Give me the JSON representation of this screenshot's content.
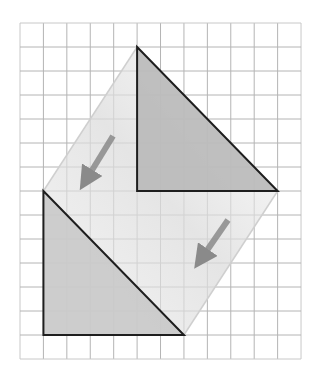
{
  "diagram": {
    "type": "translation-on-grid",
    "grid": {
      "origin_px": [
        20,
        23
      ],
      "columns": 12,
      "rows": 14,
      "cell_w": 23.42,
      "cell_h": 24.0,
      "line_color": "#b4b4b4",
      "border_color": "#c8c8c8"
    },
    "preimage": {
      "label": "",
      "shape": "right-triangle",
      "vertices_grid": [
        [
          5,
          1
        ],
        [
          5,
          7
        ],
        [
          11,
          7
        ]
      ],
      "fill": "#b9b9b9",
      "stroke": "#1e1e1e"
    },
    "image": {
      "label": "",
      "shape": "right-triangle",
      "vertices_grid": [
        [
          1,
          7
        ],
        [
          1,
          13
        ],
        [
          7,
          13
        ]
      ],
      "fill": "#c9c9c9",
      "stroke": "#1e1e1e"
    },
    "translation_vector_grid": [
      -4,
      6
    ],
    "sweep_color": "#e6e6e6",
    "arrows": [
      {
        "name": "arrow-left",
        "from_px": [
          113,
          136
        ],
        "to_px": [
          86,
          180
        ],
        "color": "#8a8a8a"
      },
      {
        "name": "arrow-right",
        "from_px": [
          228,
          220
        ],
        "to_px": [
          201,
          259
        ],
        "color": "#8a8a8a"
      }
    ]
  }
}
